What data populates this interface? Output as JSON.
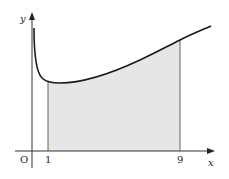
{
  "diagram": {
    "type": "area-under-curve",
    "axes": {
      "x_label": "x",
      "y_label": "y",
      "origin_label": "O"
    },
    "ticks": {
      "x": [
        "1",
        "9"
      ]
    },
    "shaded_region": {
      "from": "1",
      "to": "9",
      "fill": "#e6e6e6"
    },
    "colors": {
      "curve": "#1a1a1a",
      "axis": "#333333",
      "shade": "#e6e6e6",
      "boundary": "#555555"
    }
  }
}
